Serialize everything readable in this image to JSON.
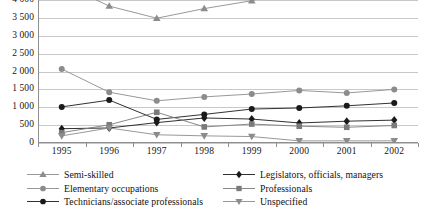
{
  "chart_data": {
    "type": "line",
    "title": "",
    "xlabel": "",
    "ylabel": "",
    "categories": [
      "1995",
      "1996",
      "1997",
      "1998",
      "1999",
      "2000",
      "2001",
      "2002"
    ],
    "ylim": [
      0,
      4000
    ],
    "ytick_labels": [
      "0",
      "500",
      "1 000",
      "1 500",
      "2 000",
      "2 500",
      "3 000",
      "3 500",
      "4 000"
    ],
    "ytick_values": [
      0,
      500,
      1000,
      1500,
      2000,
      2500,
      3000,
      3500,
      4000
    ],
    "grid": true,
    "legend_position": "bottom",
    "note": "Semi-skilled series exceeds the plotted axis maximum at 1995 and from 2000 onward; its line exits the top of the frame.",
    "series": [
      {
        "name": "Semi-skilled",
        "marker": "triangle-up",
        "color": "#8c8c8c",
        "values": [
          4450,
          3830,
          3490,
          3760,
          3980,
          4350,
          4620,
          4900
        ]
      },
      {
        "name": "Elementary occupations",
        "marker": "circle",
        "color": "#8c8c8c",
        "values": [
          2070,
          1420,
          1180,
          1290,
          1370,
          1470,
          1400,
          1500
        ]
      },
      {
        "name": "Technicians/associate professionals",
        "marker": "circle-filled",
        "color": "#1a1a1a",
        "values": [
          1010,
          1200,
          660,
          800,
          950,
          980,
          1040,
          1120
        ]
      },
      {
        "name": "Legislators, officials, managers",
        "marker": "diamond",
        "color": "#1a1a1a",
        "values": [
          400,
          420,
          570,
          700,
          670,
          560,
          610,
          640
        ]
      },
      {
        "name": "Professionals",
        "marker": "square",
        "color": "#7a7a7a",
        "values": [
          290,
          510,
          860,
          450,
          530,
          470,
          440,
          490
        ]
      },
      {
        "name": "Unspecified",
        "marker": "triangle-down",
        "color": "#8c8c8c",
        "values": [
          200,
          420,
          230,
          200,
          180,
          60,
          60,
          60
        ]
      }
    ]
  },
  "legend": {
    "columns": [
      {
        "items": [
          {
            "label": "Semi-skilled",
            "marker": "triangle-up",
            "color": "#8c8c8c"
          },
          {
            "label": "Elementary occupations",
            "marker": "circle",
            "color": "#8c8c8c"
          },
          {
            "label": "Technicians/associate professionals",
            "marker": "circle-filled",
            "color": "#1a1a1a"
          }
        ]
      },
      {
        "items": [
          {
            "label": "Legislators, officials, managers",
            "marker": "diamond",
            "color": "#1a1a1a"
          },
          {
            "label": "Professionals",
            "marker": "square",
            "color": "#7a7a7a"
          },
          {
            "label": "Unspecified",
            "marker": "triangle-down",
            "color": "#8c8c8c"
          }
        ]
      }
    ]
  }
}
